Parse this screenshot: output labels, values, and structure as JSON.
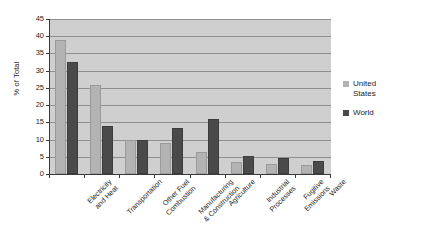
{
  "chart_data": {
    "type": "bar",
    "title": "",
    "xlabel": "",
    "ylabel": "% of Total",
    "ylim": [
      0,
      45
    ],
    "yticks": [
      0,
      5,
      10,
      15,
      20,
      25,
      30,
      35,
      40,
      45
    ],
    "grid": true,
    "legend_position": "right",
    "categories": [
      "Electricity and Heat",
      "Transportation",
      "Other Fuel Combustion",
      "Manufacturing & Construction",
      "Agriculture",
      "Industrial Processes",
      "Fugitive Emissions",
      "Waste"
    ],
    "category_lines": [
      [
        "Electricity",
        "and Heat"
      ],
      [
        "Transportation",
        ""
      ],
      [
        "Other Fuel",
        "Combustion"
      ],
      [
        "Manufacturing",
        "& Construction"
      ],
      [
        "Agriculture",
        ""
      ],
      [
        "Industrial",
        "Processes"
      ],
      [
        "Fugitive",
        "Emissions"
      ],
      [
        "Waste",
        ""
      ]
    ],
    "series": [
      {
        "name": "United States",
        "color": "#b3b3b3",
        "values": [
          39.0,
          25.8,
          10.0,
          9.0,
          6.3,
          3.5,
          3.0,
          2.6
        ]
      },
      {
        "name": "World",
        "color": "#4a4a4a",
        "values": [
          32.5,
          14.0,
          9.8,
          13.5,
          16.1,
          5.2,
          4.7,
          3.9
        ]
      }
    ]
  },
  "legend": {
    "items": [
      {
        "label_line1": "United",
        "label_line2": "States",
        "color": "#b3b3b3"
      },
      {
        "label_line1": "World",
        "label_line2": "",
        "color": "#4a4a4a"
      }
    ]
  },
  "axis": {
    "y_title": "% of Total"
  },
  "colors": {
    "plot_background": "#cfcfcf",
    "gridline": "#8f8f8f",
    "axis": "#3a3a3a",
    "series_united_states": "#b3b3b3",
    "series_world": "#4a4a4a",
    "text": "#1d1d1d"
  }
}
